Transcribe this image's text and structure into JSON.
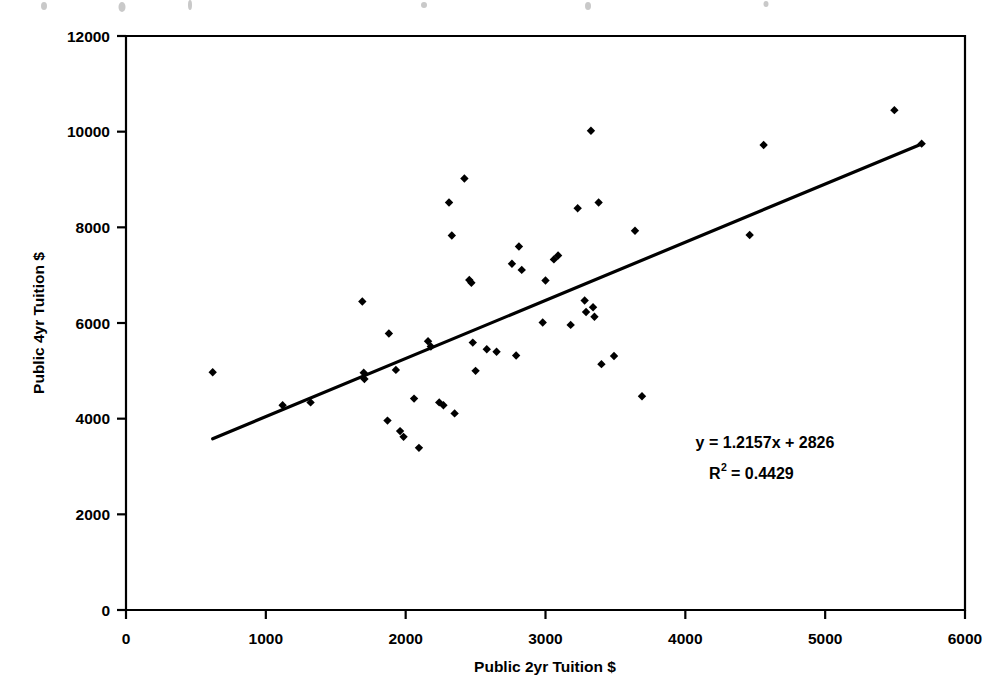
{
  "chart_data": {
    "type": "scatter",
    "title": "",
    "xlabel": "Public 2yr Tuition $",
    "ylabel": "Public 4yr Tuition $",
    "xlim": [
      0,
      6000
    ],
    "ylim": [
      0,
      12000
    ],
    "xticks": [
      0,
      1000,
      2000,
      3000,
      4000,
      5000,
      6000
    ],
    "yticks": [
      0,
      2000,
      4000,
      6000,
      8000,
      10000,
      12000
    ],
    "xtick_labels": [
      "0",
      "1000",
      "2000",
      "3000",
      "4000",
      "5000",
      "6000"
    ],
    "ytick_labels": [
      "0",
      "2000",
      "4000",
      "6000",
      "8000",
      "10000",
      "12000"
    ],
    "grid": false,
    "legend": false,
    "marker": "diamond",
    "marker_color": "#000000",
    "series": [
      {
        "name": "State tuition pairs",
        "points": [
          [
            620,
            4970
          ],
          [
            1120,
            4280
          ],
          [
            1320,
            4340
          ],
          [
            1690,
            6450
          ],
          [
            1700,
            4960
          ],
          [
            1705,
            4830
          ],
          [
            1880,
            5780
          ],
          [
            1870,
            3960
          ],
          [
            1930,
            5020
          ],
          [
            1960,
            3740
          ],
          [
            1985,
            3620
          ],
          [
            2060,
            4420
          ],
          [
            2095,
            3390
          ],
          [
            2160,
            5620
          ],
          [
            2180,
            5510
          ],
          [
            2240,
            4340
          ],
          [
            2270,
            4280
          ],
          [
            2310,
            8520
          ],
          [
            2330,
            7830
          ],
          [
            2350,
            4110
          ],
          [
            2420,
            9020
          ],
          [
            2455,
            6900
          ],
          [
            2470,
            6840
          ],
          [
            2480,
            5590
          ],
          [
            2500,
            5000
          ],
          [
            2580,
            5450
          ],
          [
            2650,
            5400
          ],
          [
            2760,
            7240
          ],
          [
            2790,
            5320
          ],
          [
            2810,
            7600
          ],
          [
            2830,
            7110
          ],
          [
            2980,
            6010
          ],
          [
            3000,
            6890
          ],
          [
            3060,
            7330
          ],
          [
            3090,
            7410
          ],
          [
            3180,
            5960
          ],
          [
            3230,
            8400
          ],
          [
            3280,
            6470
          ],
          [
            3290,
            6230
          ],
          [
            3325,
            10020
          ],
          [
            3340,
            6330
          ],
          [
            3350,
            6130
          ],
          [
            3380,
            8520
          ],
          [
            3400,
            5140
          ],
          [
            3490,
            5310
          ],
          [
            3640,
            7930
          ],
          [
            3690,
            4470
          ],
          [
            4460,
            7840
          ],
          [
            4560,
            9720
          ],
          [
            5495,
            10450
          ],
          [
            5690,
            9750
          ]
        ]
      }
    ],
    "trendline": {
      "equation": "y = 1.2157x + 2826",
      "r_squared_label": "R",
      "r_squared_sup": "2",
      "r_squared_value": "= 0.4429",
      "slope": 1.2157,
      "intercept": 2826,
      "r_squared": 0.4429,
      "x_start": 620,
      "x_end": 5690
    }
  }
}
